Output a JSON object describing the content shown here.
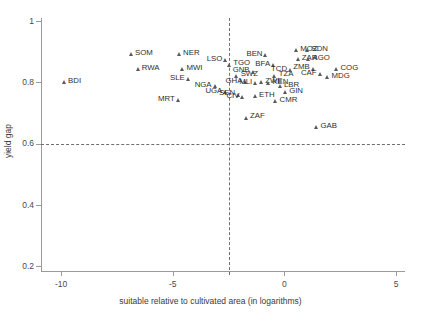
{
  "chart_data": {
    "type": "scatter",
    "title": "",
    "xlabel": "suitable relative to cultivated area (in logarithms)",
    "ylabel": "yield gap",
    "xlim": [
      -10.9,
      5.4
    ],
    "ylim": [
      0.185,
      1.01
    ],
    "xticks": [
      "-10",
      "-5",
      "0",
      "5"
    ],
    "xtick_values": [
      -10,
      -5,
      0,
      5
    ],
    "yticks": [
      "0.2",
      "0.4",
      "0.6",
      "0.8",
      "1"
    ],
    "ytick_values": [
      0.2,
      0.4,
      0.6,
      0.8,
      1
    ],
    "grid": false,
    "legend": "none",
    "reference_lines": [
      {
        "axis": "y",
        "value": 0.6,
        "style": "dashed"
      },
      {
        "axis": "x",
        "value": -2.5,
        "style": "dashed"
      }
    ],
    "marker": "triangle",
    "marker_color": "#5a5a5a",
    "points": [
      {
        "label": "BDI",
        "x": -9.85,
        "y": 0.8,
        "side": "right"
      },
      {
        "label": "SOM",
        "x": -6.85,
        "y": 0.893,
        "side": "right"
      },
      {
        "label": "RWA",
        "x": -6.55,
        "y": 0.843,
        "side": "right"
      },
      {
        "label": "NER",
        "x": -4.7,
        "y": 0.893,
        "side": "right"
      },
      {
        "label": "MWI",
        "x": -4.55,
        "y": 0.843,
        "side": "right"
      },
      {
        "label": "SLE",
        "x": -4.3,
        "y": 0.81,
        "side": "left"
      },
      {
        "label": "MRT",
        "x": -4.75,
        "y": 0.742,
        "side": "left"
      },
      {
        "label": "NGA",
        "x": -3.1,
        "y": 0.788,
        "side": "left"
      },
      {
        "label": "UGA",
        "x": -2.62,
        "y": 0.768,
        "side": "left"
      },
      {
        "label": "LSO",
        "x": -2.62,
        "y": 0.872,
        "side": "left"
      },
      {
        "label": "TGO",
        "x": -2.45,
        "y": 0.858,
        "side": "right"
      },
      {
        "label": "SWZ",
        "x": -2.12,
        "y": 0.822,
        "side": "right"
      },
      {
        "label": "SEN",
        "x": -2.05,
        "y": 0.76,
        "side": "left"
      },
      {
        "label": "CIV",
        "x": -1.85,
        "y": 0.752,
        "side": "left"
      },
      {
        "label": "GHA",
        "x": -1.72,
        "y": 0.8,
        "side": "left"
      },
      {
        "label": "ZAF",
        "x": -1.7,
        "y": 0.685,
        "side": "right"
      },
      {
        "label": "GNB",
        "x": -1.4,
        "y": 0.835,
        "side": "left"
      },
      {
        "label": "ETH",
        "x": -1.3,
        "y": 0.755,
        "side": "right"
      },
      {
        "label": "MLI",
        "x": -1.28,
        "y": 0.797,
        "side": "left"
      },
      {
        "label": "ZWE",
        "x": -1.02,
        "y": 0.802,
        "side": "right"
      },
      {
        "label": "BEN",
        "x": -0.82,
        "y": 0.888,
        "side": "left"
      },
      {
        "label": "KEN",
        "x": -0.7,
        "y": 0.797,
        "side": "right"
      },
      {
        "label": "BFA",
        "x": -0.48,
        "y": 0.855,
        "side": "left"
      },
      {
        "label": "TZA",
        "x": -0.42,
        "y": 0.822,
        "side": "right"
      },
      {
        "label": "CMR",
        "x": -0.38,
        "y": 0.74,
        "side": "right"
      },
      {
        "label": "LBR",
        "x": -0.18,
        "y": 0.788,
        "side": "right"
      },
      {
        "label": "GIN",
        "x": 0.05,
        "y": 0.768,
        "side": "right"
      },
      {
        "label": "TCD",
        "x": 0.28,
        "y": 0.84,
        "side": "left"
      },
      {
        "label": "MOZ",
        "x": 0.55,
        "y": 0.905,
        "side": "right"
      },
      {
        "label": "ZAR",
        "x": 0.62,
        "y": 0.875,
        "side": "right"
      },
      {
        "label": "SDN",
        "x": 1.05,
        "y": 0.905,
        "side": "right"
      },
      {
        "label": "AGO",
        "x": 1.1,
        "y": 0.875,
        "side": "right"
      },
      {
        "label": "ZMB",
        "x": 1.3,
        "y": 0.845,
        "side": "left"
      },
      {
        "label": "CAF",
        "x": 1.6,
        "y": 0.828,
        "side": "left"
      },
      {
        "label": "MDG",
        "x": 1.95,
        "y": 0.818,
        "side": "right"
      },
      {
        "label": "COG",
        "x": 2.35,
        "y": 0.843,
        "side": "right"
      },
      {
        "label": "GAB",
        "x": 1.45,
        "y": 0.655,
        "side": "right"
      }
    ]
  }
}
